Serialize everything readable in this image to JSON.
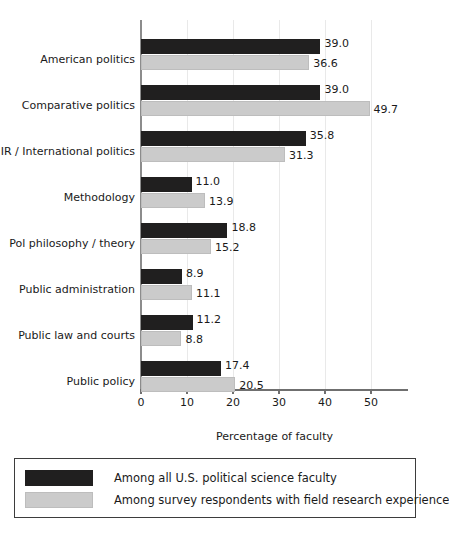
{
  "chart_data": {
    "type": "bar",
    "orientation": "horizontal",
    "title": "",
    "xlabel": "Percentage of faculty",
    "ylabel": "",
    "xlim": [
      0,
      58
    ],
    "xticks": [
      0,
      10,
      20,
      30,
      40,
      50
    ],
    "grid": true,
    "legend_position": "bottom",
    "categories": [
      "American politics",
      "Comparative politics",
      "IR / International politics",
      "Methodology",
      "Pol philosophy / theory",
      "Public administration",
      "Public law and courts",
      "Public policy"
    ],
    "series": [
      {
        "name": "Among all U.S. political science faculty",
        "color": "#201f1f",
        "values": [
          39.0,
          39.0,
          35.8,
          11.0,
          18.8,
          8.9,
          11.2,
          17.4
        ],
        "labels": [
          "39.0",
          "39.0",
          "35.8",
          "11.0",
          "18.8",
          "8.9",
          "11.2",
          "17.4"
        ]
      },
      {
        "name": "Among survey respondents with field research experience",
        "color": "#cbcbcb",
        "values": [
          36.6,
          49.7,
          31.3,
          13.9,
          15.2,
          11.1,
          8.8,
          20.5
        ],
        "labels": [
          "36.6",
          "49.7",
          "31.3",
          "13.9",
          "15.2",
          "11.1",
          "8.8",
          "20.5"
        ]
      }
    ]
  },
  "axis": {
    "tick_labels": [
      "0",
      "10",
      "20",
      "30",
      "40",
      "50"
    ],
    "x_title": "Percentage of faculty"
  },
  "legend": {
    "items": [
      {
        "label": "Among all U.S. political science faculty",
        "swatch": "dark"
      },
      {
        "label": "Among survey respondents with field research experience",
        "swatch": "light"
      }
    ]
  },
  "colors": {
    "series_dark": "#201f1f",
    "series_light": "#cbcbcb",
    "axis": "#6f6f6f",
    "grid": "#e9e9e9",
    "text": "#1a1a1a"
  }
}
